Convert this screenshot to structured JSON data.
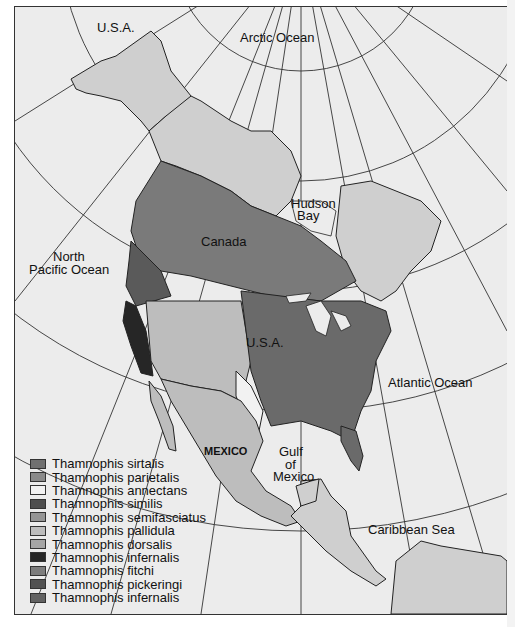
{
  "map": {
    "labels": {
      "usa_alaska": "U.S.A.",
      "arctic_ocean": "Arctic Ocean",
      "hudson_bay_1": "Hudson",
      "hudson_bay_2": "Bay",
      "canada": "Canada",
      "north_pacific_1": "North",
      "north_pacific_2": "Pacific Ocean",
      "usa": "U.S.A.",
      "atlantic_ocean": "Atlantic Ocean",
      "mexico": "MEXICO",
      "gulf_1": "Gulf",
      "gulf_2": "of",
      "gulf_3": "Mexico",
      "caribbean_sea": "Caribbean Sea"
    },
    "colors": {
      "ocean": "#ececec",
      "land_outside": "#cfcfcf",
      "grid": "#333333",
      "border": "#222222"
    }
  },
  "legend": {
    "items": [
      {
        "label": "Thamnophis sirtalis",
        "color": "#707070"
      },
      {
        "label": "Thamnophis parietalis",
        "color": "#8a8a8a"
      },
      {
        "label": "Thamnophis annectans",
        "color": "#f2f2f2"
      },
      {
        "label": "Thamnophis similis",
        "color": "#4e4e4e"
      },
      {
        "label": "Thamnophis semifasciatus",
        "color": "#959595"
      },
      {
        "label": "Thamnophis pallidula",
        "color": "#bdbdbd"
      },
      {
        "label": "Thamnophis dorsalis",
        "color": "#a5a5a5"
      },
      {
        "label": "Thamnophis infernalis",
        "color": "#262626"
      },
      {
        "label": "Thamnophis fitchi",
        "color": "#7d7d7d"
      },
      {
        "label": "Thamnophis pickeringi",
        "color": "#525252"
      },
      {
        "label": "Thamnophis infernalis",
        "color": "#626262"
      }
    ]
  }
}
